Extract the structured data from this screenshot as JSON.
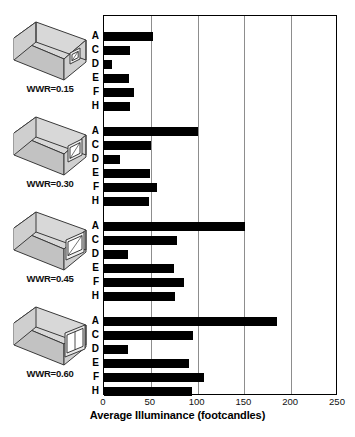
{
  "chart_data": {
    "type": "bar",
    "orientation": "horizontal",
    "title": "",
    "xlabel": "Average Illuminance (footcandles)",
    "ylabel": "",
    "xlim": [
      0,
      250
    ],
    "xticks": [
      0,
      50,
      100,
      150,
      200,
      250
    ],
    "grid": true,
    "legend": "none",
    "categories": [
      "A",
      "C",
      "D",
      "E",
      "F",
      "H"
    ],
    "groups": [
      {
        "name": "WWR=0.15",
        "label": "WWR=0.15",
        "icon": "building-box-small-window-icon",
        "categories": [
          "A",
          "C",
          "D",
          "E",
          "F",
          "H"
        ],
        "values": [
          52,
          28,
          9,
          27,
          32,
          28
        ]
      },
      {
        "name": "WWR=0.30",
        "label": "WWR=0.30",
        "icon": "building-box-medium-window-icon",
        "categories": [
          "A",
          "C",
          "D",
          "E",
          "F",
          "H"
        ],
        "values": [
          100,
          50,
          17,
          49,
          57,
          48
        ]
      },
      {
        "name": "WWR=0.45",
        "label": "WWR=0.45",
        "icon": "building-box-large-window-icon",
        "categories": [
          "A",
          "C",
          "D",
          "E",
          "F",
          "H"
        ],
        "values": [
          151,
          78,
          26,
          75,
          86,
          76
        ]
      },
      {
        "name": "WWR=0.60",
        "label": "WWR=0.60",
        "icon": "building-box-xlarge-window-icon",
        "categories": [
          "A",
          "C",
          "D",
          "E",
          "F",
          "H"
        ],
        "values": [
          185,
          95,
          26,
          91,
          107,
          94
        ]
      }
    ],
    "colors": {
      "bar": "#000000",
      "grid": "#8d8d8d",
      "axis": "#000000",
      "background": "#ffffff",
      "icon_fill": "#c9c9c9",
      "icon_stroke": "#3a3a3a"
    }
  }
}
